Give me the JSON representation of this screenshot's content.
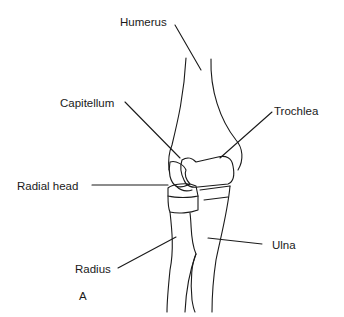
{
  "labels": {
    "humerus": "Humerus",
    "capitellum": "Capitellum",
    "trochlea": "Trochlea",
    "radial_head": "Radial head",
    "ulna": "Ulna",
    "radius": "Radius",
    "panel": "A"
  }
}
